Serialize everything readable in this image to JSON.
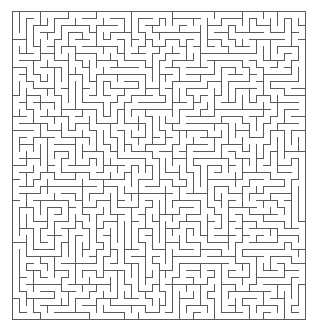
{
  "maze": {
    "canvas": {
      "width": 316,
      "height": 321,
      "background": "#ffffff"
    },
    "bounds": {
      "left": 12,
      "top": 11,
      "right": 305,
      "bottom": 319
    },
    "cols": 42,
    "rows": 44,
    "wall_color": "#5a5a5a",
    "wall_width": 1,
    "seed": 7319
  }
}
